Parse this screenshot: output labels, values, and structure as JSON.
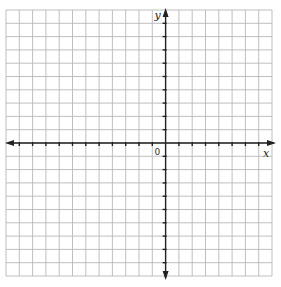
{
  "figure": {
    "type": "coordinate-plane",
    "x_axis_label": "x",
    "y_axis_label": "y",
    "origin_label": "0",
    "grid": {
      "columns": 20,
      "rows": 20,
      "left": 6,
      "top": 10,
      "cell": 13.3,
      "origin_col": 12,
      "origin_row": 10
    },
    "colors": {
      "grid": "#b8b8b8",
      "axis": "#222222",
      "background": "#ffffff"
    }
  }
}
